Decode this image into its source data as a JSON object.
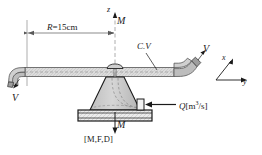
{
  "figure": {
    "labels": {
      "radius_symbol": "R",
      "radius_value": "=15cm",
      "axis_z": "z",
      "torque_top": "M",
      "control_volume": "C.V",
      "velocity_right": "V",
      "velocity_left": "V",
      "axis_x": "x",
      "axis_y": "y",
      "flow_symbol": "Q",
      "flow_units_open": "[m",
      "flow_units_exp": "3",
      "flow_units_close": "/s]",
      "torque_bottom": "M",
      "bottom_tag": "[M,F,D]"
    },
    "colors": {
      "background": "#ffffff",
      "line": "#1a1a1a",
      "pipe_fill": "#d8d8d8",
      "pipe_edge": "#6e6e6e",
      "cone_fill": "#c9c9c9",
      "base_fill": "#e6e6e6",
      "dimension_line": "#595959",
      "centerline": "#9a9a9a"
    }
  }
}
